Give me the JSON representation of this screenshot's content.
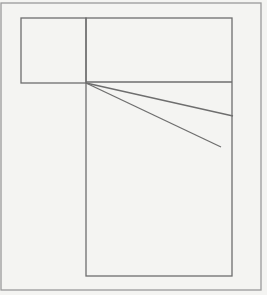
{
  "diagram": {
    "background": "#f4f4f2",
    "stroke_outer": "#9a9a9a",
    "stroke_inner": "#6e6e6e",
    "outer_frame": {
      "x": 1,
      "y": 3,
      "w": 260,
      "h": 287
    },
    "small_rect": {
      "x": 21,
      "y": 18,
      "w": 65,
      "h": 65
    },
    "large_rect": {
      "x": 86,
      "y": 18,
      "w": 146,
      "h": 258
    },
    "divider": {
      "x1": 86,
      "y1": 82,
      "x2": 232,
      "y2": 82
    },
    "ray_upper": {
      "x1": 86,
      "y1": 83,
      "x2": 233,
      "y2": 116
    },
    "ray_lower": {
      "x1": 86,
      "y1": 83,
      "x2": 221,
      "y2": 147
    }
  }
}
